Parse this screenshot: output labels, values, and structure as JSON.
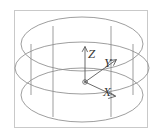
{
  "figure": {
    "background_color": "#ffffff",
    "border_color": "#c9c9c9",
    "line_color": "#8c8c8c",
    "axis_line_color": "#5a5a5a",
    "label_color": "#3a3a3a",
    "frame": {
      "x": 14,
      "y": 10,
      "width": 134,
      "height": 118
    },
    "geometry": {
      "shape": "cylinder",
      "center_x": 82,
      "top_ellipse": {
        "cx": 82,
        "cy": 44,
        "rx": 61,
        "ry": 27
      },
      "mid_ellipse": {
        "cx": 82,
        "cy": 68,
        "rx": 67,
        "ry": 26
      },
      "bottom_ellipse": {
        "cx": 82,
        "cy": 95,
        "rx": 61,
        "ry": 27
      },
      "wall_lines": [
        {
          "x": 31,
          "y1": 44,
          "y2": 95
        },
        {
          "x": 53,
          "y1": 26,
          "y2": 117
        },
        {
          "x": 111,
          "y1": 26,
          "y2": 117
        },
        {
          "x": 133,
          "y1": 44,
          "y2": 95
        }
      ]
    },
    "axes": {
      "origin": {
        "x": 85,
        "y": 82
      },
      "origin_marker": "circle-dot",
      "items": [
        {
          "name": "z-axis",
          "label": "Z",
          "tip": {
            "x": 85,
            "y": 47
          },
          "label_pos": {
            "x": 88,
            "y": 58
          },
          "arrow": "up"
        },
        {
          "name": "y-axis",
          "label": "Y",
          "tip": {
            "x": 116,
            "y": 60
          },
          "label_pos": {
            "x": 104,
            "y": 67
          },
          "arrow": "upper-right"
        },
        {
          "name": "x-axis",
          "label": "X",
          "tip": {
            "x": 114,
            "y": 95
          },
          "label_pos": {
            "x": 103,
            "y": 95
          },
          "arrow": "lower-right"
        }
      ]
    }
  }
}
